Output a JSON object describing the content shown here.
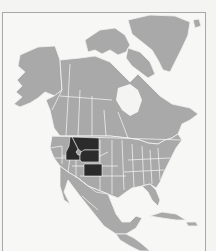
{
  "map": {
    "title": "",
    "region": "North America",
    "highlighted_regions": [
      "Idaho",
      "Montana",
      "Wyoming",
      "Colorado"
    ],
    "colors": {
      "land": "#a9a9a9",
      "highlight": "#2b2b2b",
      "borders": "#efefef",
      "water": "#f4f4f2",
      "frame": "#a8a8a8"
    }
  }
}
